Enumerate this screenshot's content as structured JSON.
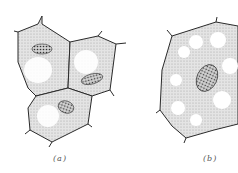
{
  "figure": {
    "panels": [
      {
        "id": "a",
        "label": "(a)",
        "description": "Group of three young plant cells, each with dense cytoplasm, small vacuoles and a granular nucleus"
      },
      {
        "id": "b",
        "label": "(b)",
        "description": "Single mature plant cell with many vacuoles and an oval granular nucleus"
      }
    ],
    "colors": {
      "outline": "#2a2a2a",
      "cytoplasm": "#dcdcdc",
      "vacuole": "#ffffff",
      "nucleus": "#c8c8c8"
    }
  }
}
